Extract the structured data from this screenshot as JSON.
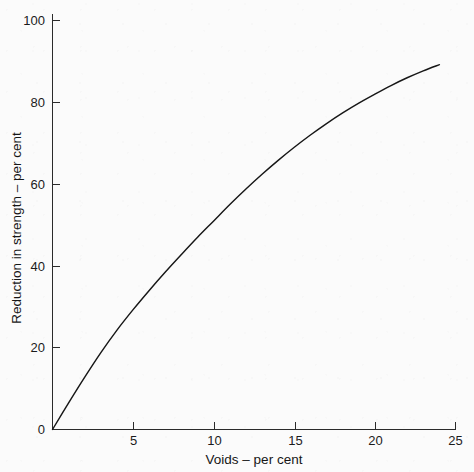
{
  "figure": {
    "background_color": "#fbfbfb",
    "ink_color": "#1b1b1b"
  },
  "chart_data": {
    "type": "line",
    "title": "",
    "subtitle": "",
    "xlabel": "Voids – per cent",
    "ylabel": "Reduction in strength – per cent",
    "xlim": [
      0,
      25
    ],
    "ylim": [
      0,
      100
    ],
    "xticks": [
      0,
      5,
      10,
      15,
      20,
      25
    ],
    "xticklabels": [
      "0",
      "5",
      "10",
      "15",
      "20",
      "25"
    ],
    "yticks": [
      0,
      20,
      40,
      60,
      80,
      100
    ],
    "yticklabels": [
      "0",
      "20",
      "40",
      "60",
      "80",
      "100"
    ],
    "grid": false,
    "legend": false,
    "legend_position": "none",
    "annotations": [],
    "series": [
      {
        "name": "Reduction in strength",
        "x": [
          0,
          1,
          2,
          3,
          4,
          5,
          6,
          7,
          8,
          9,
          10,
          11,
          12,
          13,
          14,
          15,
          16,
          17,
          18,
          19,
          20,
          21,
          22,
          23,
          24
        ],
        "y": [
          0,
          6.5,
          12.8,
          18.8,
          24.3,
          29.3,
          34.0,
          38.5,
          42.8,
          47.0,
          51.0,
          55.0,
          58.8,
          62.4,
          65.8,
          69.0,
          72.0,
          74.8,
          77.4,
          79.8,
          82.0,
          84.1,
          86.0,
          87.7,
          89.2
        ]
      }
    ]
  },
  "axes": {
    "x_axis_label": "Voids – per cent",
    "y_axis_label": "Reduction in strength – per cent",
    "x_tick_labels": [
      "0",
      "5",
      "10",
      "15",
      "20",
      "25"
    ],
    "y_tick_labels": [
      "0",
      "20",
      "40",
      "60",
      "80",
      "100"
    ]
  }
}
